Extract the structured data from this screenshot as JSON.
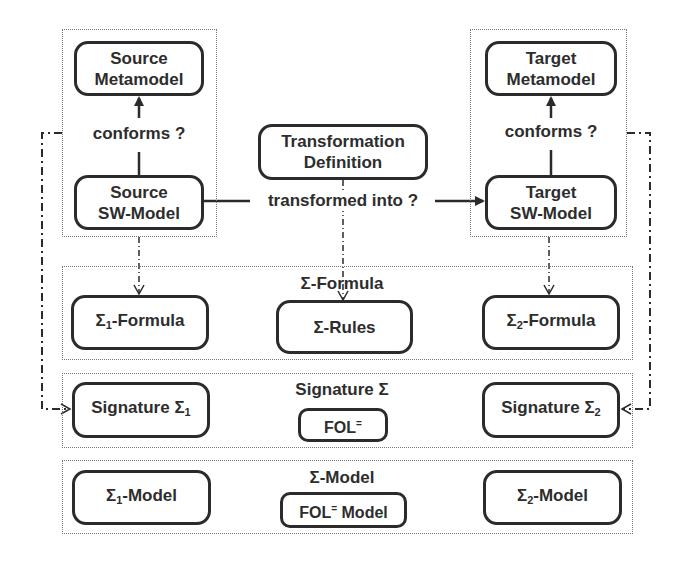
{
  "diagram": {
    "source_group": {
      "metamodel": {
        "line1": "Source",
        "line2": "Metamodel"
      },
      "conforms_label": "conforms ?",
      "sw_model": {
        "line1": "Source",
        "line2": "SW-Model"
      }
    },
    "target_group": {
      "metamodel": {
        "line1": "Target",
        "line2": "Metamodel"
      },
      "conforms_label": "conforms ?",
      "sw_model": {
        "line1": "Target",
        "line2": "SW-Model"
      }
    },
    "transformation": {
      "definition": {
        "line1": "Transformation",
        "line2": "Definition"
      },
      "edge_label": "transformed into ?"
    },
    "formula_layer": {
      "title": "Σ-Formula",
      "left": {
        "prefix": "Σ",
        "sub": "1",
        "suffix": "-Formula"
      },
      "center": "Σ-Rules",
      "right": {
        "prefix": "Σ",
        "sub": "2",
        "suffix": "-Formula"
      }
    },
    "signature_layer": {
      "title": "Signature Σ",
      "left": {
        "prefix": "Signature Σ",
        "sub": "1"
      },
      "center": {
        "prefix": "FOL",
        "sup": "="
      },
      "right": {
        "prefix": "Signature Σ",
        "sub": "2"
      }
    },
    "model_layer": {
      "title": "Σ-Model",
      "left": {
        "prefix": "Σ",
        "sub": "1",
        "suffix": "-Model"
      },
      "center": {
        "prefix": "FOL",
        "sup": "=",
        "suffix": " Model"
      },
      "right": {
        "prefix": "Σ",
        "sub": "2",
        "suffix": "-Model"
      }
    },
    "colors": {
      "stroke": "#2b2b2b",
      "frame": "#777777",
      "background": "#ffffff"
    }
  }
}
